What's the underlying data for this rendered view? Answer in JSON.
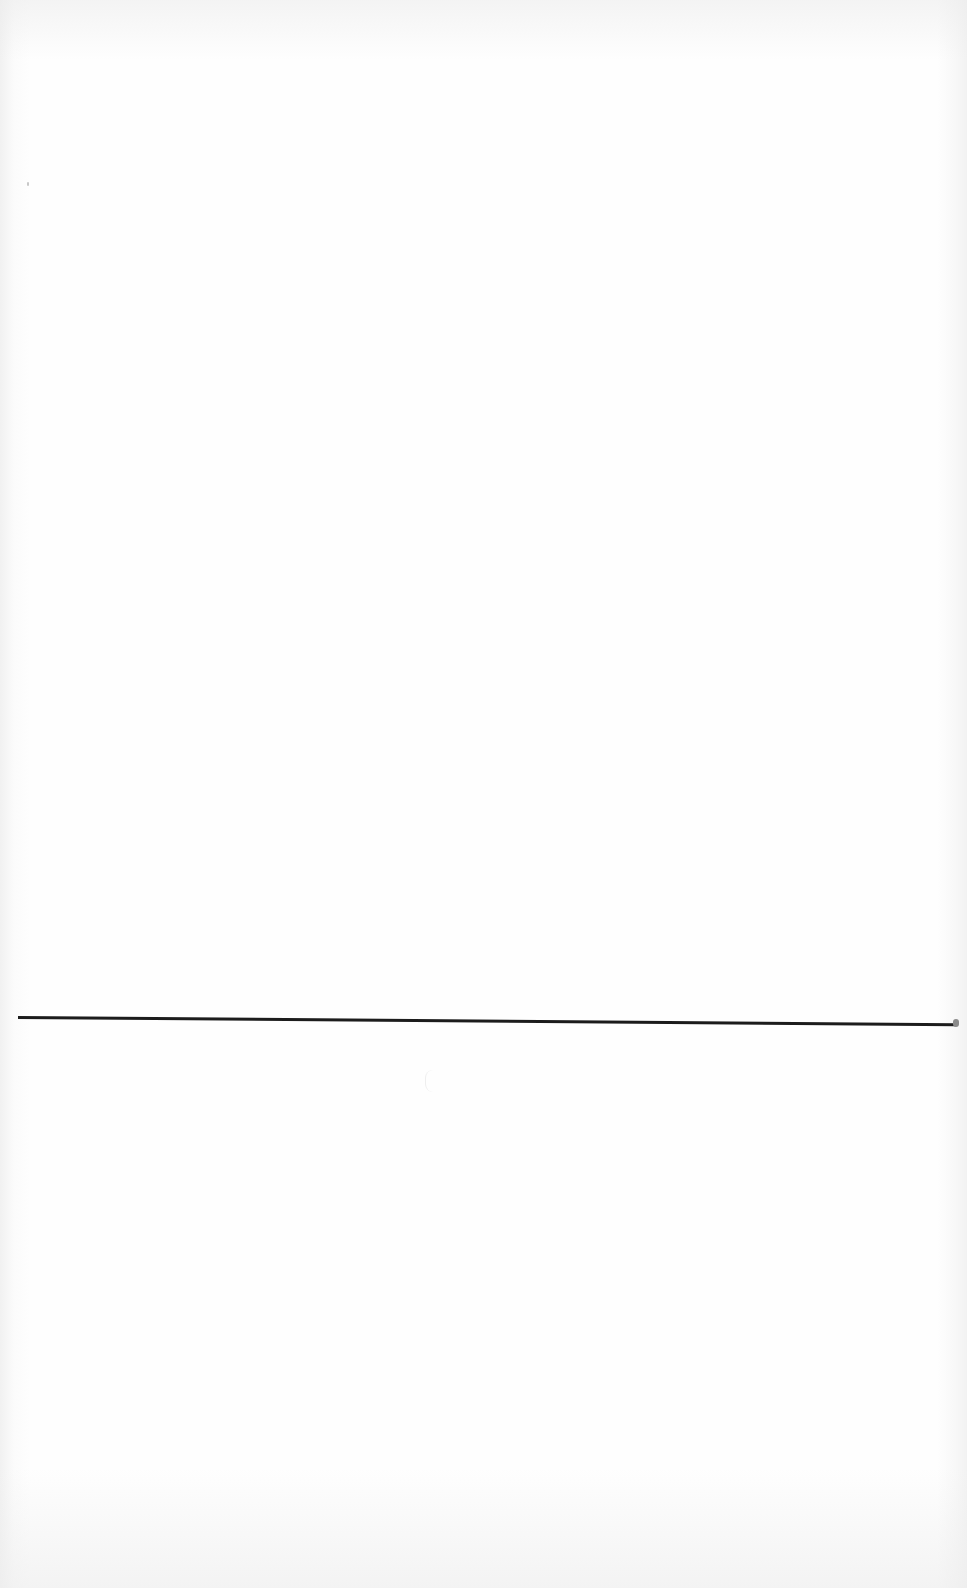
{
  "page": {
    "type": "scanned-blank-page",
    "background_color": "#fefefe",
    "rule_color": "#1c1c1c",
    "text": []
  }
}
